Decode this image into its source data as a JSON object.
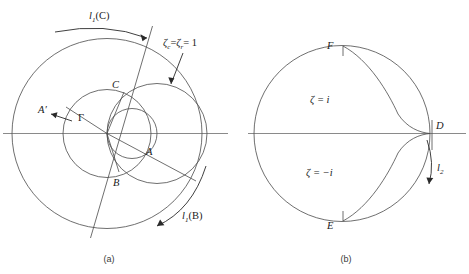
{
  "figure": {
    "panels": [
      {
        "id": "a",
        "caption": "(a)",
        "labels": {
          "locus_c": "l",
          "locus_c_sub": "1",
          "locus_c_arg": "(C)",
          "locus_b": "l",
          "locus_b_sub": "1",
          "locus_b_arg": "(B)",
          "zeta_condition": "ζ",
          "zeta_condition_sub_c": "c",
          "zeta_condition_eq1": "=",
          "zeta_condition_r": "ζ",
          "zeta_condition_sub_r": "r",
          "zeta_condition_eq2": "= 1",
          "point_A": "A",
          "point_Aprime": "A′",
          "point_B": "B",
          "point_C": "C",
          "gamma": "Γ"
        }
      },
      {
        "id": "b",
        "caption": "(b)",
        "labels": {
          "zeta_plus_i": "ζ = i",
          "zeta_minus_i": "ζ = −i",
          "point_D": "D",
          "point_E": "E",
          "point_F": "F",
          "locus_l2": "l",
          "locus_l2_sub": "2"
        }
      }
    ],
    "figure_caption": "",
    "colors": {
      "curve": "#4a4a4a",
      "axis": "#8a8a8a",
      "text": "#1a1a1a",
      "caption": "#3a3a3a",
      "background": "#ffffff"
    }
  }
}
